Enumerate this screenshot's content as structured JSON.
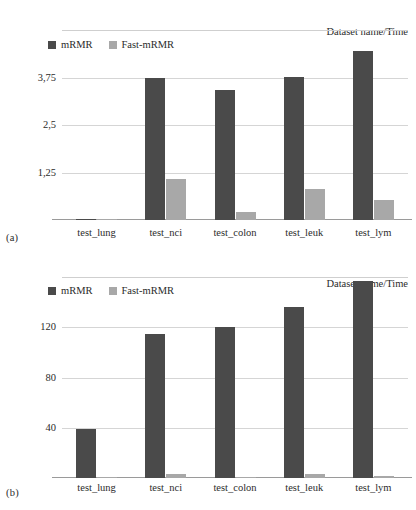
{
  "figure": {
    "panels": [
      {
        "letter": "(a)",
        "header_label": "Dataset name/Time",
        "chart_data": {
          "type": "bar",
          "title": "",
          "subtitle": "",
          "xlabel": "",
          "ylabel": "",
          "annotations": [
            "Dataset name/Time"
          ],
          "categories": [
            "test_lung",
            "test_nci",
            "test_colon",
            "test_leuk",
            "test_lym"
          ],
          "series": [
            {
              "name": "mRMR",
              "color": "#4a4a4a",
              "values": [
                0.03,
                3.75,
                3.43,
                3.77,
                4.45
              ]
            },
            {
              "name": "Fast-mRMR",
              "color": "#a8a8a8",
              "values": [
                0.03,
                1.08,
                0.2,
                0.82,
                0.52
              ]
            }
          ],
          "ylim": [
            0,
            5
          ],
          "yticks": [
            1.25,
            2.5,
            3.75
          ],
          "ytick_labels": [
            "1,25",
            "2,5",
            "3,75"
          ],
          "grid": true,
          "legend_position": "top-left",
          "legend": [
            "mRMR",
            "Fast-mRMR"
          ]
        }
      },
      {
        "letter": "(b)",
        "header_label": "Dataset name/Time",
        "chart_data": {
          "type": "bar",
          "title": "",
          "subtitle": "",
          "xlabel": "",
          "ylabel": "",
          "annotations": [
            "Dataset name/Time"
          ],
          "categories": [
            "test_lung",
            "test_nci",
            "test_colon",
            "test_leuk",
            "test_lym"
          ],
          "series": [
            {
              "name": "mRMR",
              "color": "#4a4a4a",
              "values": [
                39,
                115,
                120,
                136,
                157
              ]
            },
            {
              "name": "Fast-mRMR",
              "color": "#a8a8a8",
              "values": [
                0.5,
                3,
                1,
                3,
                2
              ]
            }
          ],
          "ylim": [
            0,
            160
          ],
          "yticks": [
            40,
            80,
            120
          ],
          "ytick_labels": [
            "40",
            "80",
            "120"
          ],
          "grid": true,
          "legend_position": "top-left",
          "legend": [
            "mRMR",
            "Fast-mRMR"
          ]
        }
      }
    ]
  }
}
